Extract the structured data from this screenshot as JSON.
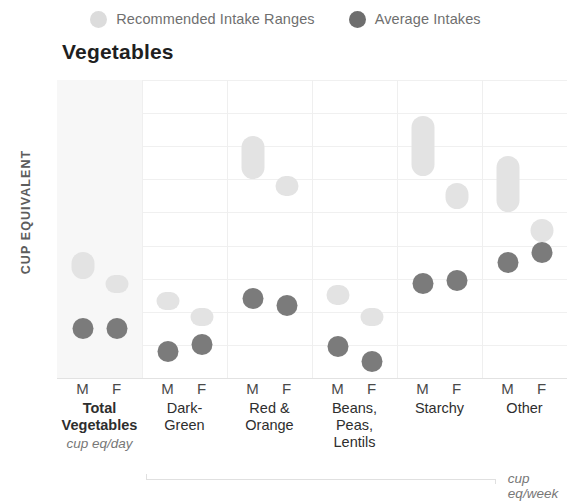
{
  "legend": {
    "items": [
      {
        "name": "range-legend",
        "label": "Recommended Intake Ranges",
        "color": "#dcdcdc"
      },
      {
        "name": "average-legend",
        "label": "Average Intakes",
        "color": "#6e6e6e"
      }
    ]
  },
  "chart_data": {
    "type": "range-dot",
    "title": "Vegetables",
    "xlabel": "",
    "ylabel": "CUP EQUIVALENT",
    "ylim": [
      0,
      9
    ],
    "yticks": [
      0,
      1,
      2,
      3,
      4,
      5,
      6,
      7,
      8,
      9
    ],
    "grid": true,
    "legend_position": "top-center",
    "sex_ticks": [
      "M",
      "F"
    ],
    "unit_notes": [
      {
        "text": "cup eq/day",
        "applies_to": [
          "Total Vegetables"
        ]
      },
      {
        "text": "cup eq/week",
        "applies_to": [
          "Dark-Green",
          "Red & Orange",
          "Beans, Peas, Lentils",
          "Starchy",
          "Other"
        ]
      }
    ],
    "colors": {
      "range": "#e3e3e3",
      "average": "#7b7b7b",
      "grid": "#f0f0f0",
      "highlight_panel": "#f7f7f7"
    },
    "groups": [
      {
        "name": "Total Vegetables",
        "label_lines": [
          "Total",
          "Vegetables"
        ],
        "bold": true,
        "highlighted": true,
        "unit": "cup eq/day",
        "points": [
          {
            "sex": "M",
            "range_low": 3.0,
            "range_high": 3.8,
            "average": 1.5
          },
          {
            "sex": "F",
            "range_low": 2.6,
            "range_high": 3.1,
            "average": 1.5
          }
        ]
      },
      {
        "name": "Dark-Green",
        "label_lines": [
          "Dark-",
          "Green"
        ],
        "bold": false,
        "highlighted": false,
        "unit": "cup eq/week",
        "points": [
          {
            "sex": "M",
            "range_low": 2.1,
            "range_high": 2.6,
            "average": 0.8
          },
          {
            "sex": "F",
            "range_low": 1.7,
            "range_high": 2.1,
            "average": 1.0
          }
        ]
      },
      {
        "name": "Red & Orange",
        "label_lines": [
          "Red &",
          "Orange"
        ],
        "bold": false,
        "highlighted": false,
        "unit": "cup eq/week",
        "points": [
          {
            "sex": "M",
            "range_low": 6.0,
            "range_high": 7.3,
            "average": 2.4
          },
          {
            "sex": "F",
            "range_low": 5.5,
            "range_high": 6.1,
            "average": 2.2
          }
        ]
      },
      {
        "name": "Beans, Peas, Lentils",
        "label_lines": [
          "Beans,",
          "Peas,",
          "Lentils"
        ],
        "bold": false,
        "highlighted": false,
        "unit": "cup eq/week",
        "points": [
          {
            "sex": "M",
            "range_low": 2.2,
            "range_high": 2.8,
            "average": 0.95
          },
          {
            "sex": "F",
            "range_low": 1.6,
            "range_high": 2.1,
            "average": 0.5
          }
        ]
      },
      {
        "name": "Starchy",
        "label_lines": [
          "Starchy"
        ],
        "bold": false,
        "highlighted": false,
        "unit": "cup eq/week",
        "points": [
          {
            "sex": "M",
            "range_low": 6.1,
            "range_high": 7.9,
            "average": 2.85
          },
          {
            "sex": "F",
            "range_low": 5.1,
            "range_high": 5.9,
            "average": 2.95
          }
        ]
      },
      {
        "name": "Other",
        "label_lines": [
          "Other"
        ],
        "bold": false,
        "highlighted": false,
        "unit": "cup eq/week",
        "points": [
          {
            "sex": "M",
            "range_low": 5.0,
            "range_high": 6.7,
            "average": 3.5
          },
          {
            "sex": "F",
            "range_low": 4.1,
            "range_high": 4.8,
            "average": 3.8
          }
        ]
      }
    ]
  }
}
